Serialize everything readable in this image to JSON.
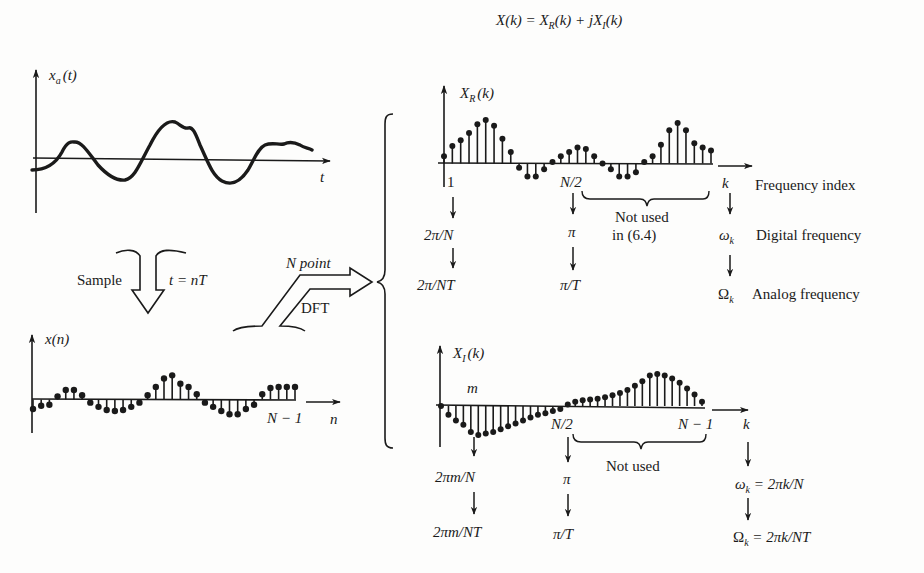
{
  "title": {
    "equation": "X(k) = X_R(k) + jX_I(k)",
    "parts": [
      "X(k) = X",
      "R",
      "(k) + jX",
      "I",
      "(k)"
    ]
  },
  "analog_signal": {
    "y_label": "x",
    "y_label_sub": "a",
    "y_label_arg": "(t)",
    "x_label": "t"
  },
  "sample_step": {
    "label_left": "Sample",
    "label_right": "t = nT"
  },
  "discrete_signal": {
    "y_label": "x(n)",
    "end_label": "N − 1",
    "x_label": "n",
    "values": [
      -0.9,
      -0.6,
      -0.5,
      0.3,
      0.9,
      0.9,
      0.4,
      -0.3,
      -0.7,
      -1.0,
      -1.1,
      -1.0,
      -0.7,
      -0.3,
      0.4,
      1.2,
      2.0,
      2.3,
      1.5,
      1.2,
      0.5,
      -0.3,
      -0.7,
      -1.1,
      -1.4,
      -1.4,
      -0.9,
      -0.5,
      0.5,
      1.1,
      1.2,
      1.2,
      1.2
    ]
  },
  "dft_step": {
    "label_top": "N point",
    "label_bottom": "DFT"
  },
  "real_part": {
    "y_label": "X",
    "y_label_sub": "R",
    "y_label_arg": "(k)",
    "tick_first": "1",
    "tick_mid": "N/2",
    "x_label": "k",
    "values": [
      0.5,
      1.2,
      1.6,
      2.1,
      2.7,
      3.0,
      2.6,
      1.7,
      0.8,
      -0.3,
      -0.9,
      -0.9,
      -0.4,
      0.1,
      0.5,
      0.8,
      1.1,
      1.0,
      0.5,
      0.0,
      -0.4,
      -0.9,
      -0.9,
      -0.6,
      0.1,
      0.5,
      1.3,
      2.3,
      2.8,
      2.3,
      1.4,
      1.1,
      0.9
    ],
    "brace_label_line1": "Not used",
    "brace_label_line2": "in (6.4)",
    "mappings": {
      "first": [
        "2π/N",
        "2π/NT"
      ],
      "mid": [
        "π",
        "π/T"
      ],
      "k": [
        "ω",
        "Ω"
      ]
    },
    "right_labels": [
      "Frequency index",
      "Digital frequency",
      "Analog frequency"
    ]
  },
  "imag_part": {
    "y_label": "X",
    "y_label_sub": "I",
    "y_label_arg": "(k)",
    "tick_m": "m",
    "tick_mid": "N/2",
    "tick_end": "N − 1",
    "x_label": "k",
    "values": [
      0.0,
      -0.6,
      -1.0,
      -1.3,
      -1.8,
      -2.0,
      -1.9,
      -1.8,
      -1.6,
      -1.4,
      -1.2,
      -1.0,
      -0.8,
      -0.6,
      -0.5,
      -0.35,
      -0.2,
      0.1,
      0.3,
      0.4,
      0.45,
      0.5,
      0.6,
      0.75,
      0.9,
      1.1,
      1.4,
      1.7,
      2.1,
      2.2,
      2.1,
      1.9,
      1.6,
      1.2,
      0.8,
      0.3
    ],
    "brace_label": "Not used",
    "mappings": {
      "m": [
        "2πm/N",
        "2πm/NT"
      ],
      "mid": [
        "π",
        "π/T"
      ],
      "k_omega": "ω",
      "k_omega_rhs": " = 2πk/N",
      "k_Omega": "Ω",
      "k_Omega_rhs": " = 2πk/NT"
    },
    "sub_k": "k"
  }
}
